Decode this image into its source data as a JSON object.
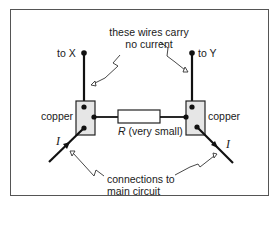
{
  "labels": {
    "top_note_line1": "these wires carry",
    "top_note_line2": "no current",
    "to_x": "to X",
    "to_y": "to Y",
    "copper_left": "copper",
    "copper_right": "copper",
    "resistor": "R (very small)",
    "resistor_symbol": "R",
    "resistor_desc": "(very small)",
    "current_left": "I",
    "current_right": "I",
    "bottom_note_line1": "connections to",
    "bottom_note_line2": "main circuit"
  },
  "colors": {
    "line": "#111111",
    "copper_fill": "#e6e6e6",
    "frame": "#555555"
  }
}
